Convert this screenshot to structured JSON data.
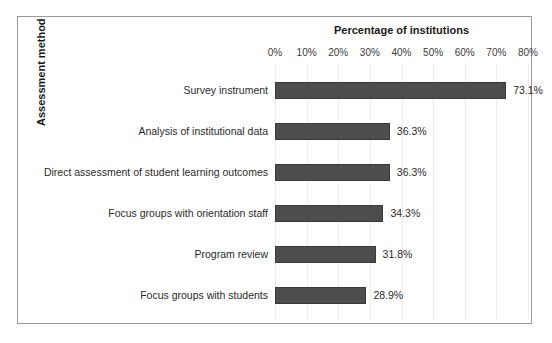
{
  "chart_data": {
    "type": "bar",
    "orientation": "horizontal",
    "title": "Percentage of institutions",
    "xlabel": "Percentage of institutions",
    "ylabel": "Assessment method",
    "categories": [
      "Survey instrument",
      "Analysis of institutional data",
      "Direct assessment of student learning outcomes",
      "Focus groups with orientation staff",
      "Program review",
      "Focus groups with students"
    ],
    "values": [
      73.1,
      36.3,
      36.3,
      34.3,
      31.8,
      28.9
    ],
    "value_labels": [
      "73.1%",
      "36.3%",
      "36.3%",
      "34.3%",
      "31.8%",
      "28.9%"
    ],
    "xlim": [
      0,
      80
    ],
    "xticks": [
      0,
      10,
      20,
      30,
      40,
      50,
      60,
      70,
      80
    ],
    "xtick_labels": [
      "0%",
      "10%",
      "20%",
      "30%",
      "40%",
      "50%",
      "60%",
      "70%",
      "80%"
    ],
    "grid": true,
    "legend": false,
    "bar_color": "#4d4d4d",
    "bar_edge_color": "#3a3a3a",
    "frame_color": "#9a9a9a",
    "background_color": "#ffffff",
    "text_color": "#2a2a2a"
  }
}
